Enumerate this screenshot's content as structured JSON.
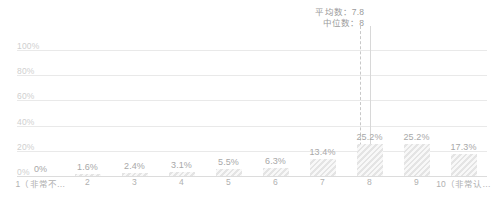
{
  "chart_data": {
    "type": "bar",
    "title": "",
    "subtitle": "",
    "xlabel": "",
    "ylabel": "",
    "ylim": [
      0,
      100
    ],
    "grid": true,
    "legend_position": "none",
    "categories": [
      "1（非常不…",
      "2",
      "3",
      "4",
      "5",
      "6",
      "7",
      "8",
      "9",
      "10（非常认…"
    ],
    "values": [
      0,
      1.6,
      2.4,
      3.1,
      5.5,
      6.3,
      13.4,
      25.2,
      25.2,
      17.3
    ],
    "value_labels": [
      "0%",
      "1.6%",
      "2.4%",
      "3.1%",
      "5.5%",
      "6.3%",
      "13.4%",
      "25.2%",
      "25.2%",
      "17.3%"
    ],
    "ytick_labels": [
      "100%",
      "80%",
      "60%",
      "40%",
      "20%",
      "0%"
    ],
    "ytick_values": [
      100,
      80,
      60,
      40,
      20,
      0
    ],
    "annotations": {
      "mean_text": "平均数：7.8",
      "median_text": "中位数：8",
      "mean_value": 7.8,
      "median_value": 8
    },
    "colors": {
      "bar_fill": "#e4e4e4",
      "grid": "#e9e9e9",
      "baseline": "#dcdcdc",
      "label_text": "#a8a8a8",
      "axis_text": "#b0b0b0",
      "ytick_text": "#cfcfcf",
      "stat_text": "#9b9b9b",
      "marker_mean": "#c8c8c8",
      "marker_median": "#d8d8d8"
    }
  }
}
